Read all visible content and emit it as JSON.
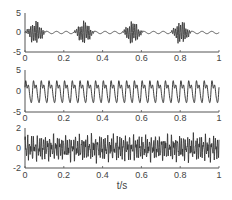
{
  "chart_data": [
    {
      "type": "line",
      "title": "",
      "xlabel": "",
      "ylabel": "",
      "xlim": [
        0,
        1
      ],
      "ylim": [
        -5,
        5
      ],
      "xticks": [
        "0",
        "0.2",
        "0.4",
        "0.6",
        "0.8",
        "1"
      ],
      "yticks": [
        "5",
        "0",
        "-5"
      ],
      "grid": false,
      "description": "Amplitude-modulated burst signal: ~8 high-frequency bursts (amplitude ~3) separated by quiet low-amplitude segments",
      "series": [
        {
          "name": "signal 1",
          "burst_count": 8,
          "carrier_amplitude": 3,
          "burst_period_s": 0.125
        }
      ]
    },
    {
      "type": "line",
      "title": "",
      "xlabel": "",
      "ylabel": "",
      "xlim": [
        0,
        1
      ],
      "ylim": [
        -5,
        5
      ],
      "xticks": [
        "0",
        "0.2",
        "0.4",
        "0.6",
        "0.8",
        "1"
      ],
      "yticks": [
        "5",
        "0",
        "-5"
      ],
      "grid": false,
      "description": "Periodic waveform with ~25 cycles, amplitude ~3, peaky shape with small secondary oscillation",
      "series": [
        {
          "name": "signal 2",
          "cycles": 25,
          "amplitude": 3
        }
      ]
    },
    {
      "type": "line",
      "title": "",
      "xlabel": "t/s",
      "ylabel": "",
      "xlim": [
        0,
        1
      ],
      "ylim": [
        -2,
        2
      ],
      "xticks": [
        "0",
        "0.2",
        "0.4",
        "0.6",
        "0.8",
        "1"
      ],
      "yticks": [
        "2",
        "0",
        "-2"
      ],
      "grid": false,
      "description": "Dense noise-like high-frequency signal, amplitude ~1.5",
      "series": [
        {
          "name": "signal 3",
          "amplitude": 1.5
        }
      ]
    }
  ],
  "panels": [
    {
      "yticks": [
        "5",
        "0",
        "-5"
      ],
      "xticks": [
        "0",
        "0.2",
        "0.4",
        "0.6",
        "0.8",
        "1"
      ]
    },
    {
      "yticks": [
        "5",
        "0",
        "-5"
      ],
      "xticks": [
        "0",
        "0.2",
        "0.4",
        "0.6",
        "0.8",
        "1"
      ]
    },
    {
      "yticks": [
        "2",
        "0",
        "-2"
      ],
      "xticks": [
        "0",
        "0.2",
        "0.4",
        "0.6",
        "0.8",
        "1"
      ]
    }
  ],
  "xlabel": "t/s",
  "colors": {
    "line": "#2a2a2a",
    "axis": "#555555"
  }
}
